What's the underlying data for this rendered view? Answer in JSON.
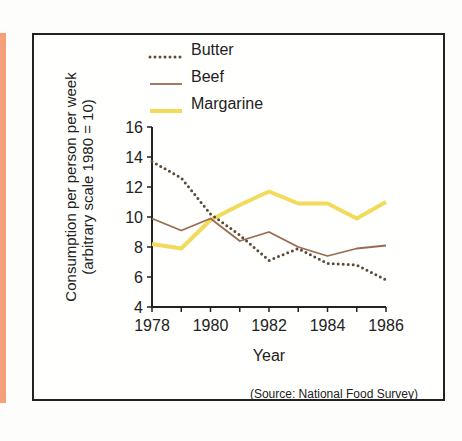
{
  "chart_data": {
    "type": "line",
    "title": "",
    "xlabel": "Year",
    "ylabel": "Consumption per person per week",
    "ylabel_sub": "(arbitrary scale 1980 = 10)",
    "x": [
      1978,
      1979,
      1980,
      1981,
      1982,
      1983,
      1984,
      1985,
      1986
    ],
    "x_tick_labels": [
      "1978",
      "1980",
      "1982",
      "1984",
      "1986"
    ],
    "y_ticks": [
      4,
      6,
      8,
      10,
      12,
      14,
      16
    ],
    "ylim": [
      4,
      16
    ],
    "legend_position": "top",
    "grid": false,
    "series": [
      {
        "name": "Butter",
        "style": "dotted",
        "color": "#5a4a3a",
        "values": [
          13.7,
          12.6,
          10.2,
          8.8,
          7.1,
          7.9,
          6.9,
          6.8,
          5.8
        ]
      },
      {
        "name": "Beef",
        "style": "solid",
        "color": "#9a6a52",
        "values": [
          9.9,
          9.1,
          9.9,
          8.4,
          9.0,
          8.0,
          7.4,
          7.9,
          8.1
        ]
      },
      {
        "name": "Margarine",
        "style": "solid-thick",
        "color": "#f2da5a",
        "values": [
          8.2,
          7.9,
          9.8,
          10.8,
          11.7,
          10.9,
          10.9,
          9.9,
          11.0
        ]
      }
    ],
    "source": "(Source: National Food Survey)"
  }
}
